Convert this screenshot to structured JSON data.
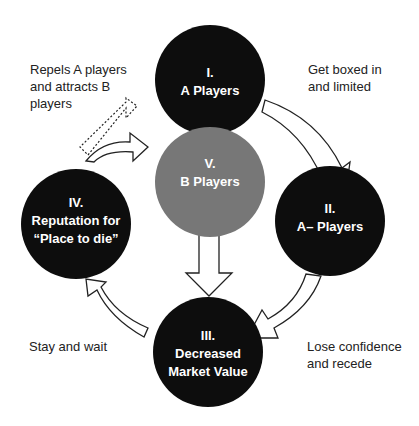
{
  "colors": {
    "node_dark": "#0d0d0d",
    "node_gray": "#777777",
    "arrow_stroke": "#222222",
    "text": "#222222",
    "background": "#ffffff"
  },
  "nodes": [
    {
      "id": "I",
      "numeral": "I.",
      "lines": [
        "A Players"
      ],
      "cx": 210,
      "cy": 80,
      "r": 55,
      "fill": "dark"
    },
    {
      "id": "II",
      "numeral": "II.",
      "lines": [
        "A– Players"
      ],
      "cx": 330,
      "cy": 221,
      "r": 55,
      "fill": "dark"
    },
    {
      "id": "III",
      "numeral": "III.",
      "lines": [
        "Decreased",
        "Market Value"
      ],
      "cx": 208,
      "cy": 352,
      "r": 55,
      "fill": "dark"
    },
    {
      "id": "IV",
      "numeral": "IV.",
      "lines": [
        "Reputation for",
        "“Place to die”"
      ],
      "cx": 76,
      "cy": 224,
      "r": 55,
      "fill": "dark"
    },
    {
      "id": "V",
      "numeral": "V.",
      "lines": [
        "B Players"
      ],
      "cx": 210,
      "cy": 182,
      "r": 55,
      "fill": "gray"
    }
  ],
  "edges": [
    {
      "from": "I",
      "to": "II",
      "label": "Get boxed in\nand limited",
      "style": "solid"
    },
    {
      "from": "II",
      "to": "III",
      "label": "Lose confidence\nand recede",
      "style": "solid"
    },
    {
      "from": "III",
      "to": "IV",
      "label": "Stay and wait",
      "style": "solid"
    },
    {
      "from": "IV",
      "to": "V",
      "label": "Repels A players\nand attracts B\nplayers",
      "style": "solid"
    },
    {
      "from": "IV",
      "to": "I",
      "label": "",
      "style": "dashed"
    },
    {
      "from": "V",
      "to": "III",
      "label": "",
      "style": "solid"
    }
  ],
  "labels": {
    "top_left": "Repels A players\nand attracts B\nplayers",
    "top_right": "Get boxed in\nand limited",
    "bottom_left": "Stay and wait",
    "bottom_right": "Lose confidence\nand recede"
  }
}
